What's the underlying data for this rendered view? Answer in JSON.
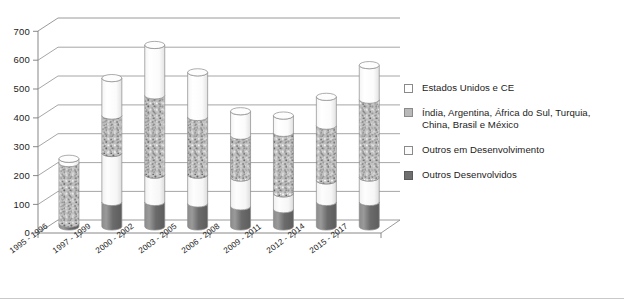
{
  "chart_data": {
    "type": "bar",
    "subtype": "stacked-cylinder-3d",
    "title": "",
    "xlabel": "",
    "ylabel": "",
    "ylim": [
      0,
      700
    ],
    "yticks": [
      0,
      100,
      200,
      300,
      400,
      500,
      600,
      700
    ],
    "grid": true,
    "legend_position": "right",
    "categories": [
      "1995 - 1996",
      "1997 - 1999",
      "2000 - 2002",
      "2003 - 2005",
      "2006 - 2008",
      "2009 - 2011",
      "2012 - 2014",
      "2015 - 2017"
    ],
    "series": [
      {
        "name": "Outros Desenvolvidos",
        "fill": "dark",
        "color": "#6f6f6f",
        "values": [
          10,
          85,
          85,
          80,
          70,
          60,
          85,
          85
        ]
      },
      {
        "name": "Outros em Desenvolvimento",
        "fill": "light",
        "color": "#fbfbfb",
        "values": [
          0,
          170,
          95,
          100,
          100,
          55,
          75,
          85
        ]
      },
      {
        "name": "Índia, Argentina, África do Sul, Turquia, China, Brasil e México",
        "fill": "speckled",
        "color": "#b9b9b9",
        "values": [
          210,
          130,
          275,
          200,
          145,
          210,
          190,
          270
        ]
      },
      {
        "name": "Estados Unidos e CE",
        "fill": "white",
        "color": "#ffffff",
        "values": [
          15,
          130,
          175,
          155,
          85,
          60,
          100,
          120
        ]
      }
    ],
    "totals": [
      235,
      515,
      630,
      535,
      400,
      385,
      450,
      560
    ]
  },
  "legend": {
    "items": [
      {
        "label": "Estados Unidos e CE",
        "swatch": "white"
      },
      {
        "label": "Índia, Argentina, África do Sul, Turquia, China, Brasil e México",
        "swatch": "speck"
      },
      {
        "label": "Outros em Desenvolvimento",
        "swatch": "light"
      },
      {
        "label": "Outros Desenvolvidos",
        "swatch": "dark"
      }
    ]
  },
  "colors": {
    "axis": "#7c7c7c",
    "gridline": "#8f8f8f",
    "text": "#1c1c1c",
    "dark_series": "#6f6f6f",
    "speckle_base": "#b9b9b9",
    "white_series": "#ffffff",
    "footer_rule": "#c9c9c9"
  }
}
